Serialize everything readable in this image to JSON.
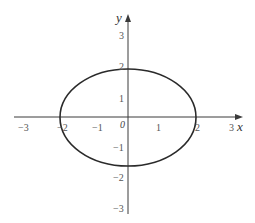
{
  "figure": {
    "x_axis_label": "x",
    "y_axis_label": "y",
    "origin_label": "0",
    "x_ticks": [
      {
        "label": "−3",
        "px": 24
      },
      {
        "label": "−2",
        "px": 62
      },
      {
        "label": "−1",
        "px": 98
      },
      {
        "label": "1",
        "px": 158
      },
      {
        "label": "2",
        "px": 197
      },
      {
        "label": "3",
        "px": 232
      }
    ],
    "y_ticks": [
      {
        "label": "3",
        "py": 39
      },
      {
        "label": "2",
        "py": 70
      },
      {
        "label": "1",
        "py": 102
      },
      {
        "label": "−1",
        "py": 151
      },
      {
        "label": "−2",
        "py": 181
      },
      {
        "label": "−3",
        "py": 212
      }
    ],
    "curve": {
      "type": "ellipse",
      "equation": "x^2/4 + y^2/3 = 1",
      "semi_major_x": 2,
      "semi_minor_y": 1.73,
      "color": "#2a2a2a"
    },
    "colors": {
      "axis": "#3a3a3a",
      "labels": "#555555",
      "background": "#ffffff"
    }
  }
}
